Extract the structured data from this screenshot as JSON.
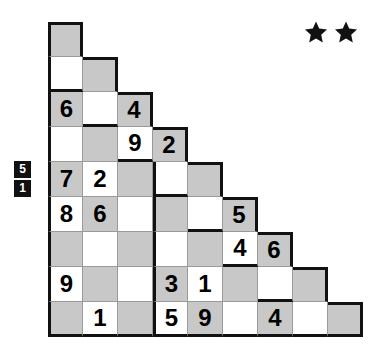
{
  "puzzle": {
    "title": "Staircase Number Grid Puzzle",
    "shape": "staircase",
    "rows": 9,
    "cell_size_px": 35,
    "colors": {
      "shaded_cell": "#c8c8c8",
      "light_cell": "#ffffff",
      "outline": "#111111",
      "gridline": "#9a9a9a",
      "clue_chip_bg": "#111111",
      "clue_chip_text": "#ffffff",
      "star": "#111111"
    }
  },
  "difficulty": {
    "label": "difficulty",
    "stars_filled": 2,
    "star_glyph": "star-icon",
    "stars": [
      "★",
      "★"
    ]
  },
  "row_clues": {
    "anchor_row": 5,
    "chips": [
      "5",
      "1"
    ]
  },
  "chart_data": {
    "type": "table",
    "row_lengths": [
      1,
      2,
      3,
      4,
      5,
      6,
      7,
      8,
      9
    ],
    "shading_rule": "checkerboard: cell (row r, col c) is shaded when (r + c) is even",
    "grid": [
      [
        {
          "shade": "shaded",
          "value": ""
        }
      ],
      [
        {
          "shade": "light",
          "value": ""
        },
        {
          "shade": "shaded",
          "value": ""
        }
      ],
      [
        {
          "shade": "shaded",
          "value": "6"
        },
        {
          "shade": "light",
          "value": ""
        },
        {
          "shade": "shaded",
          "value": "4"
        }
      ],
      [
        {
          "shade": "light",
          "value": ""
        },
        {
          "shade": "shaded",
          "value": ""
        },
        {
          "shade": "light",
          "value": "9"
        },
        {
          "shade": "shaded",
          "value": "2"
        }
      ],
      [
        {
          "shade": "shaded",
          "value": "7"
        },
        {
          "shade": "light",
          "value": "2"
        },
        {
          "shade": "shaded",
          "value": ""
        },
        {
          "shade": "light",
          "value": ""
        },
        {
          "shade": "shaded",
          "value": ""
        }
      ],
      [
        {
          "shade": "light",
          "value": "8"
        },
        {
          "shade": "shaded",
          "value": "6"
        },
        {
          "shade": "light",
          "value": ""
        },
        {
          "shade": "shaded",
          "value": ""
        },
        {
          "shade": "light",
          "value": ""
        },
        {
          "shade": "shaded",
          "value": "5"
        }
      ],
      [
        {
          "shade": "shaded",
          "value": ""
        },
        {
          "shade": "light",
          "value": ""
        },
        {
          "shade": "shaded",
          "value": ""
        },
        {
          "shade": "light",
          "value": ""
        },
        {
          "shade": "shaded",
          "value": ""
        },
        {
          "shade": "light",
          "value": "4"
        },
        {
          "shade": "shaded",
          "value": "6"
        }
      ],
      [
        {
          "shade": "light",
          "value": "9"
        },
        {
          "shade": "shaded",
          "value": ""
        },
        {
          "shade": "light",
          "value": ""
        },
        {
          "shade": "shaded",
          "value": "3"
        },
        {
          "shade": "light",
          "value": "1"
        },
        {
          "shade": "shaded",
          "value": ""
        },
        {
          "shade": "light",
          "value": ""
        },
        {
          "shade": "shaded",
          "value": ""
        }
      ],
      [
        {
          "shade": "shaded",
          "value": ""
        },
        {
          "shade": "light",
          "value": "1"
        },
        {
          "shade": "shaded",
          "value": ""
        },
        {
          "shade": "light",
          "value": "5"
        },
        {
          "shade": "shaded",
          "value": "9"
        },
        {
          "shade": "light",
          "value": ""
        },
        {
          "shade": "shaded",
          "value": "4"
        },
        {
          "shade": "light",
          "value": ""
        },
        {
          "shade": "shaded",
          "value": ""
        }
      ]
    ],
    "given_digits": [
      {
        "row": 3,
        "col": 1,
        "value": "6"
      },
      {
        "row": 3,
        "col": 3,
        "value": "4"
      },
      {
        "row": 4,
        "col": 3,
        "value": "9"
      },
      {
        "row": 4,
        "col": 4,
        "value": "2"
      },
      {
        "row": 5,
        "col": 1,
        "value": "7"
      },
      {
        "row": 5,
        "col": 2,
        "value": "2"
      },
      {
        "row": 6,
        "col": 1,
        "value": "8"
      },
      {
        "row": 6,
        "col": 2,
        "value": "6"
      },
      {
        "row": 6,
        "col": 6,
        "value": "5"
      },
      {
        "row": 7,
        "col": 6,
        "value": "4"
      },
      {
        "row": 7,
        "col": 7,
        "value": "6"
      },
      {
        "row": 8,
        "col": 1,
        "value": "9"
      },
      {
        "row": 8,
        "col": 4,
        "value": "3"
      },
      {
        "row": 8,
        "col": 5,
        "value": "1"
      },
      {
        "row": 9,
        "col": 2,
        "value": "1"
      },
      {
        "row": 9,
        "col": 4,
        "value": "5"
      },
      {
        "row": 9,
        "col": 5,
        "value": "9"
      },
      {
        "row": 9,
        "col": 7,
        "value": "4"
      }
    ],
    "thick_divider": {
      "description": "heavy vertical rule left of column 4, spanning rows 5 through 9",
      "col_left_of": 4,
      "row_start": 5,
      "row_end": 9
    }
  }
}
